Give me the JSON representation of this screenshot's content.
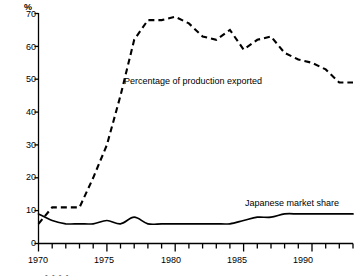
{
  "chart_data": {
    "type": "line",
    "title": "",
    "subtitle": "",
    "xlabel": "",
    "ylabel": "%",
    "y_unit_label": "%",
    "xlim": [
      1970,
      1993
    ],
    "ylim": [
      0,
      70
    ],
    "grid": false,
    "legend_position": "inline-annotations",
    "yticks": [
      0,
      10,
      20,
      30,
      40,
      50,
      60,
      70
    ],
    "ytick_labels": [
      "0",
      "10",
      "20",
      "30",
      "40",
      "50",
      "60",
      "70"
    ],
    "xticks": [
      1970,
      1971,
      1972,
      1973,
      1974,
      1975,
      1976,
      1977,
      1978,
      1979,
      1980,
      1981,
      1982,
      1983,
      1984,
      1985,
      1986,
      1987,
      1988,
      1989,
      1990,
      1991,
      1992,
      1993
    ],
    "xtick_labels_major": [
      "1970",
      "1975",
      "1980",
      "1985",
      "1990"
    ],
    "xticks_major": [
      1970,
      1975,
      1980,
      1985,
      1990
    ],
    "x": [
      1970,
      1971,
      1972,
      1973,
      1974,
      1975,
      1976,
      1977,
      1978,
      1979,
      1980,
      1981,
      1982,
      1983,
      1984,
      1985,
      1986,
      1987,
      1988,
      1989,
      1990,
      1991,
      1992,
      1993
    ],
    "series": [
      {
        "name": "Percentage of production exported",
        "style": "dashed",
        "color": "#000000",
        "values": [
          6,
          11,
          11,
          11,
          20,
          30,
          45,
          62,
          68,
          68,
          69,
          67,
          63,
          62,
          65,
          59,
          62,
          63,
          58,
          56,
          55,
          53,
          49,
          49
        ]
      },
      {
        "name": "Japanese market share",
        "style": "solid",
        "color": "#000000",
        "values": [
          9,
          7,
          6,
          6,
          6,
          7,
          6,
          8,
          6,
          6,
          6,
          6,
          6,
          6,
          6,
          7,
          8,
          8,
          9,
          9,
          9,
          9,
          9,
          9
        ]
      }
    ],
    "annotations": [
      {
        "text": "Percentage of production exported",
        "x": 1977,
        "y": 50
      },
      {
        "text": "Japanese market share",
        "x": 1987,
        "y": 16
      }
    ]
  },
  "axis": {
    "y_unit": "%",
    "y_labels": [
      "70",
      "60",
      "50",
      "40",
      "30",
      "20",
      "10",
      "0"
    ],
    "x_labels": [
      "1970",
      "1975",
      "1980",
      "1985",
      "1990"
    ]
  },
  "labels": {
    "exported": "Percentage of production exported",
    "market_share": "Japanese market share"
  },
  "colors": {
    "line": "#000000",
    "axis": "#000000",
    "background": "#ffffff"
  }
}
